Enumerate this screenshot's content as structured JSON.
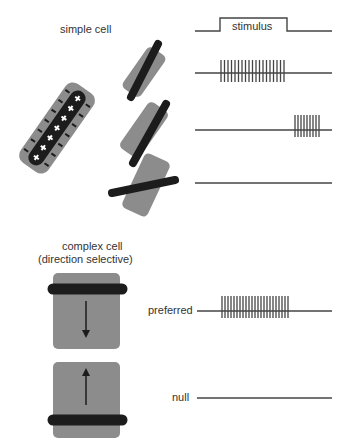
{
  "colors": {
    "field": "#8c8c8c",
    "bar": "#1c1c1c",
    "trace": "#444444",
    "background": "#ffffff"
  },
  "labels": {
    "simple_cell": "simple cell",
    "stimulus": "stimulus",
    "complex_cell_line1": "complex cell",
    "complex_cell_line2": "(direction selective)",
    "preferred": "preferred",
    "null": "null"
  },
  "simple_cell": {
    "receptive_field": {
      "on_center_symbols": [
        "+",
        "+",
        "+",
        "+",
        "+",
        "+",
        "+"
      ],
      "off_flank_symbol": "−"
    },
    "responses": [
      {
        "stimulus": "bar aligned with field",
        "spike_count": 19,
        "timing": "during stimulus"
      },
      {
        "stimulus": "bar offset from field",
        "spike_count": 9,
        "timing": "after stimulus offset"
      },
      {
        "stimulus": "bar orthogonal to field",
        "spike_count": 0,
        "timing": "none"
      }
    ]
  },
  "complex_cell": {
    "responses": [
      {
        "direction": "preferred",
        "motion": "downward",
        "spike_count": 23
      },
      {
        "direction": "null",
        "motion": "upward",
        "spike_count": 0
      }
    ]
  }
}
